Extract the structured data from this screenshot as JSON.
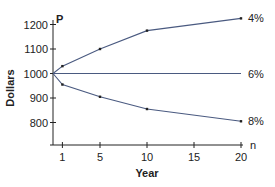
{
  "chart_data": {
    "type": "line",
    "title": "",
    "xlabel": "Year",
    "ylabel": "Dollars",
    "x_axis_symbol": "n",
    "y_axis_symbol": "P",
    "x_ticks": [
      1,
      5,
      10,
      15,
      20
    ],
    "y_ticks": [
      800,
      900,
      1000,
      1100,
      1200
    ],
    "xlim": [
      0,
      20
    ],
    "ylim": [
      720,
      1240
    ],
    "grid": false,
    "legend": "inline labels at right end of each line",
    "x": [
      0,
      1,
      5,
      10,
      20
    ],
    "series": [
      {
        "name": "4%",
        "values": [
          1000,
          1030,
          1100,
          1175,
          1225
        ]
      },
      {
        "name": "6%",
        "values": [
          1000,
          1000,
          1000,
          1000,
          1000
        ]
      },
      {
        "name": "8%",
        "values": [
          1000,
          955,
          905,
          855,
          805
        ]
      }
    ],
    "line_color": "#4a5a80"
  }
}
